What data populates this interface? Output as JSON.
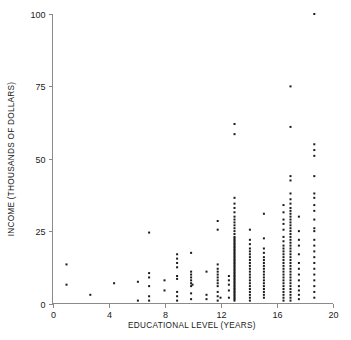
{
  "chart_data": {
    "type": "scatter",
    "title": "",
    "xlabel": "EDUCATIONAL LEVEL (YEARS)",
    "ylabel": "INCOME (THOUSANDS OF DOLLARS)",
    "xlim": [
      0,
      20
    ],
    "ylim": [
      0,
      100
    ],
    "xticks": [
      0,
      4,
      8,
      12,
      16,
      20
    ],
    "yticks": [
      0,
      25,
      50,
      75,
      100
    ],
    "xticklabels": [
      "0",
      "4",
      "8",
      "12",
      "16",
      "20"
    ],
    "yticklabels": [
      "0",
      "25",
      "50",
      "75",
      "100"
    ],
    "grid": false,
    "legend": null,
    "marker": "square",
    "marker_size": 2.0,
    "marker_color": "#1a1a1a",
    "axis_color": "#8a8a8a",
    "background_color": "#ffffff",
    "n_points": 268,
    "points": [
      [
        1.0,
        13.5
      ],
      [
        1.0,
        6.5
      ],
      [
        2.7,
        3.0
      ],
      [
        4.4,
        7.0
      ],
      [
        6.1,
        7.5
      ],
      [
        6.1,
        1.0
      ],
      [
        6.9,
        24.5
      ],
      [
        6.9,
        10.5
      ],
      [
        6.9,
        9.0
      ],
      [
        6.9,
        6.0
      ],
      [
        6.9,
        2.5
      ],
      [
        6.9,
        1.0
      ],
      [
        8.0,
        8.0
      ],
      [
        8.0,
        4.5
      ],
      [
        8.9,
        17.0
      ],
      [
        8.9,
        15.5
      ],
      [
        8.9,
        14.0
      ],
      [
        8.9,
        12.5
      ],
      [
        8.9,
        9.5
      ],
      [
        8.9,
        8.5
      ],
      [
        8.9,
        4.0
      ],
      [
        8.9,
        2.5
      ],
      [
        8.9,
        1.0
      ],
      [
        9.9,
        17.5
      ],
      [
        9.9,
        11.0
      ],
      [
        9.9,
        10.0
      ],
      [
        9.9,
        9.0
      ],
      [
        9.9,
        8.0
      ],
      [
        9.9,
        7.0
      ],
      [
        9.9,
        6.0
      ],
      [
        9.9,
        3.5
      ],
      [
        9.9,
        1.5
      ],
      [
        10.0,
        6.5
      ],
      [
        11.0,
        11.0
      ],
      [
        11.0,
        3.0
      ],
      [
        11.0,
        1.5
      ],
      [
        11.8,
        28.5
      ],
      [
        11.8,
        25.5
      ],
      [
        11.8,
        13.5
      ],
      [
        11.8,
        12.0
      ],
      [
        11.8,
        11.0
      ],
      [
        11.8,
        10.0
      ],
      [
        11.8,
        9.0
      ],
      [
        11.8,
        8.0
      ],
      [
        11.8,
        7.0
      ],
      [
        11.8,
        6.0
      ],
      [
        11.8,
        4.0
      ],
      [
        11.8,
        2.5
      ],
      [
        11.8,
        1.0
      ],
      [
        12.0,
        2.0
      ],
      [
        12.6,
        9.5
      ],
      [
        12.6,
        8.0
      ],
      [
        12.6,
        6.5
      ],
      [
        12.6,
        4.5
      ],
      [
        12.6,
        2.0
      ],
      [
        13.0,
        62.0
      ],
      [
        13.0,
        58.5
      ],
      [
        13.0,
        36.5
      ],
      [
        13.0,
        34.5
      ],
      [
        13.0,
        33.0
      ],
      [
        13.0,
        31.5
      ],
      [
        13.0,
        30.0
      ],
      [
        13.0,
        29.0
      ],
      [
        13.0,
        28.0
      ],
      [
        13.0,
        27.0
      ],
      [
        13.0,
        26.0
      ],
      [
        13.0,
        25.0
      ],
      [
        13.0,
        24.0
      ],
      [
        13.0,
        23.0
      ],
      [
        13.0,
        22.5
      ],
      [
        13.0,
        22.0
      ],
      [
        13.0,
        21.5
      ],
      [
        13.0,
        21.0
      ],
      [
        13.0,
        20.5
      ],
      [
        13.0,
        20.0
      ],
      [
        13.0,
        19.5
      ],
      [
        13.0,
        19.0
      ],
      [
        13.0,
        18.5
      ],
      [
        13.0,
        18.0
      ],
      [
        13.0,
        17.5
      ],
      [
        13.0,
        17.0
      ],
      [
        13.0,
        16.5
      ],
      [
        13.0,
        16.0
      ],
      [
        13.0,
        15.5
      ],
      [
        13.0,
        15.0
      ],
      [
        13.0,
        14.5
      ],
      [
        13.0,
        14.0
      ],
      [
        13.0,
        13.5
      ],
      [
        13.0,
        13.0
      ],
      [
        13.0,
        12.5
      ],
      [
        13.0,
        12.0
      ],
      [
        13.0,
        11.5
      ],
      [
        13.0,
        11.0
      ],
      [
        13.0,
        10.5
      ],
      [
        13.0,
        10.0
      ],
      [
        13.0,
        9.5
      ],
      [
        13.0,
        9.0
      ],
      [
        13.0,
        8.5
      ],
      [
        13.0,
        8.0
      ],
      [
        13.0,
        7.5
      ],
      [
        13.0,
        7.0
      ],
      [
        13.0,
        6.5
      ],
      [
        13.0,
        6.0
      ],
      [
        13.0,
        5.5
      ],
      [
        13.0,
        5.0
      ],
      [
        13.0,
        4.5
      ],
      [
        13.0,
        4.0
      ],
      [
        13.0,
        3.5
      ],
      [
        13.0,
        3.0
      ],
      [
        13.0,
        2.5
      ],
      [
        13.0,
        2.0
      ],
      [
        13.0,
        1.5
      ],
      [
        13.0,
        1.0
      ],
      [
        14.1,
        25.5
      ],
      [
        14.1,
        22.0
      ],
      [
        14.1,
        20.5
      ],
      [
        14.1,
        19.0
      ],
      [
        14.1,
        18.0
      ],
      [
        14.1,
        17.0
      ],
      [
        14.1,
        16.0
      ],
      [
        14.1,
        15.0
      ],
      [
        14.1,
        14.0
      ],
      [
        14.1,
        13.0
      ],
      [
        14.1,
        12.0
      ],
      [
        14.1,
        11.0
      ],
      [
        14.1,
        10.0
      ],
      [
        14.1,
        9.0
      ],
      [
        14.1,
        8.0
      ],
      [
        14.1,
        7.0
      ],
      [
        14.1,
        6.0
      ],
      [
        14.1,
        5.0
      ],
      [
        14.1,
        4.0
      ],
      [
        14.1,
        3.0
      ],
      [
        14.1,
        2.0
      ],
      [
        14.1,
        1.0
      ],
      [
        15.1,
        31.0
      ],
      [
        15.1,
        22.5
      ],
      [
        15.1,
        19.0
      ],
      [
        15.1,
        17.5
      ],
      [
        15.1,
        16.0
      ],
      [
        15.1,
        15.0
      ],
      [
        15.1,
        14.0
      ],
      [
        15.1,
        13.0
      ],
      [
        15.1,
        12.0
      ],
      [
        15.1,
        11.0
      ],
      [
        15.1,
        10.0
      ],
      [
        15.1,
        9.0
      ],
      [
        15.1,
        8.0
      ],
      [
        15.1,
        7.0
      ],
      [
        15.1,
        6.0
      ],
      [
        15.1,
        5.0
      ],
      [
        15.1,
        4.0
      ],
      [
        15.1,
        3.0
      ],
      [
        15.1,
        2.0
      ],
      [
        16.5,
        34.0
      ],
      [
        16.5,
        31.5
      ],
      [
        16.5,
        29.0
      ],
      [
        16.5,
        27.5
      ],
      [
        16.5,
        25.5
      ],
      [
        16.5,
        23.0
      ],
      [
        16.5,
        21.5
      ],
      [
        16.5,
        20.0
      ],
      [
        16.5,
        19.0
      ],
      [
        16.5,
        18.0
      ],
      [
        16.5,
        17.0
      ],
      [
        16.5,
        16.0
      ],
      [
        16.5,
        15.0
      ],
      [
        16.5,
        14.0
      ],
      [
        16.5,
        13.0
      ],
      [
        16.5,
        12.0
      ],
      [
        16.5,
        11.0
      ],
      [
        16.5,
        10.0
      ],
      [
        16.5,
        9.0
      ],
      [
        16.5,
        8.0
      ],
      [
        16.5,
        7.0
      ],
      [
        16.5,
        6.0
      ],
      [
        16.5,
        5.0
      ],
      [
        16.5,
        4.0
      ],
      [
        16.5,
        3.0
      ],
      [
        16.5,
        2.0
      ],
      [
        16.5,
        1.0
      ],
      [
        17.0,
        75.0
      ],
      [
        17.0,
        61.0
      ],
      [
        17.0,
        44.0
      ],
      [
        17.0,
        42.5
      ],
      [
        17.0,
        38.0
      ],
      [
        17.0,
        36.0
      ],
      [
        17.0,
        34.5
      ],
      [
        17.0,
        33.0
      ],
      [
        17.0,
        32.0
      ],
      [
        17.0,
        31.0
      ],
      [
        17.0,
        30.0
      ],
      [
        17.0,
        29.0
      ],
      [
        17.0,
        28.0
      ],
      [
        17.0,
        27.0
      ],
      [
        17.0,
        26.0
      ],
      [
        17.0,
        25.0
      ],
      [
        17.0,
        24.0
      ],
      [
        17.0,
        23.0
      ],
      [
        17.0,
        22.0
      ],
      [
        17.0,
        21.0
      ],
      [
        17.0,
        20.0
      ],
      [
        17.0,
        19.0
      ],
      [
        17.0,
        18.0
      ],
      [
        17.0,
        17.0
      ],
      [
        17.0,
        16.0
      ],
      [
        17.0,
        15.0
      ],
      [
        17.0,
        14.0
      ],
      [
        17.0,
        13.0
      ],
      [
        17.0,
        12.0
      ],
      [
        17.0,
        11.0
      ],
      [
        17.0,
        10.0
      ],
      [
        17.0,
        9.0
      ],
      [
        17.0,
        8.0
      ],
      [
        17.0,
        7.0
      ],
      [
        17.0,
        6.0
      ],
      [
        17.0,
        5.0
      ],
      [
        17.0,
        4.0
      ],
      [
        17.0,
        3.0
      ],
      [
        17.0,
        2.0
      ],
      [
        17.0,
        1.0
      ],
      [
        17.6,
        30.0
      ],
      [
        17.6,
        25.0
      ],
      [
        17.6,
        22.0
      ],
      [
        17.6,
        20.0
      ],
      [
        17.6,
        17.0
      ],
      [
        17.6,
        14.0
      ],
      [
        17.6,
        12.0
      ],
      [
        17.6,
        10.0
      ],
      [
        17.6,
        8.0
      ],
      [
        17.6,
        6.0
      ],
      [
        17.6,
        4.5
      ],
      [
        17.6,
        3.0
      ],
      [
        17.6,
        1.5
      ],
      [
        18.7,
        100.0
      ],
      [
        18.7,
        55.0
      ],
      [
        18.7,
        53.0
      ],
      [
        18.7,
        51.0
      ],
      [
        18.7,
        44.0
      ],
      [
        18.7,
        38.0
      ],
      [
        18.7,
        36.5
      ],
      [
        18.7,
        34.0
      ],
      [
        18.7,
        32.0
      ],
      [
        18.7,
        29.0
      ],
      [
        18.7,
        26.0
      ],
      [
        18.7,
        25.0
      ],
      [
        18.7,
        22.0
      ],
      [
        18.7,
        20.0
      ],
      [
        18.7,
        18.0
      ],
      [
        18.7,
        16.0
      ],
      [
        18.7,
        14.0
      ],
      [
        18.7,
        12.0
      ],
      [
        18.7,
        10.0
      ],
      [
        18.7,
        8.0
      ],
      [
        18.7,
        6.0
      ],
      [
        18.7,
        4.0
      ],
      [
        18.7,
        2.0
      ]
    ]
  }
}
